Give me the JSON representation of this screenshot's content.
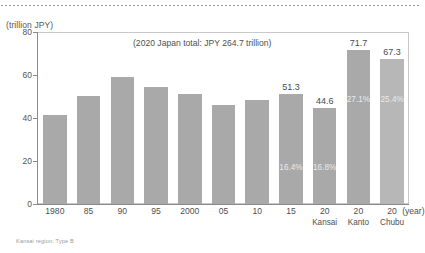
{
  "chart_data": {
    "type": "bar",
    "title": "",
    "annotation": "(2020 Japan total: JPY 264.7 trillion)",
    "ylabel": "(trillion JPY)",
    "xlabel": "(year)",
    "ylim": [
      0,
      80
    ],
    "yticks": [
      "0",
      "20",
      "40",
      "60",
      "80"
    ],
    "grid": false,
    "legend": false,
    "categories": [
      "1980",
      "85",
      "90",
      "95",
      "2000",
      "05",
      "10",
      "15",
      "20",
      "20",
      "20"
    ],
    "category_sublabels": [
      "",
      "",
      "",
      "",
      "",
      "",
      "",
      "",
      "Kansai",
      "Kanto",
      "Chubu"
    ],
    "values": [
      41.5,
      50.3,
      59.2,
      54.2,
      51.0,
      46.0,
      48.2,
      51.3,
      44.6,
      71.7,
      67.3
    ],
    "value_labels": [
      "",
      "",
      "",
      "",
      "",
      "",
      "",
      "51.3",
      "44.6",
      "71.7",
      "67.3"
    ],
    "share_labels": [
      "",
      "",
      "",
      "",
      "",
      "",
      "",
      "16.4%",
      "16.8%",
      "27.1%",
      "25.4%"
    ],
    "bar_color": "#a9a9a9",
    "bar_color_last": "#b7b7b7"
  },
  "caption": "Kansai region: Type B"
}
